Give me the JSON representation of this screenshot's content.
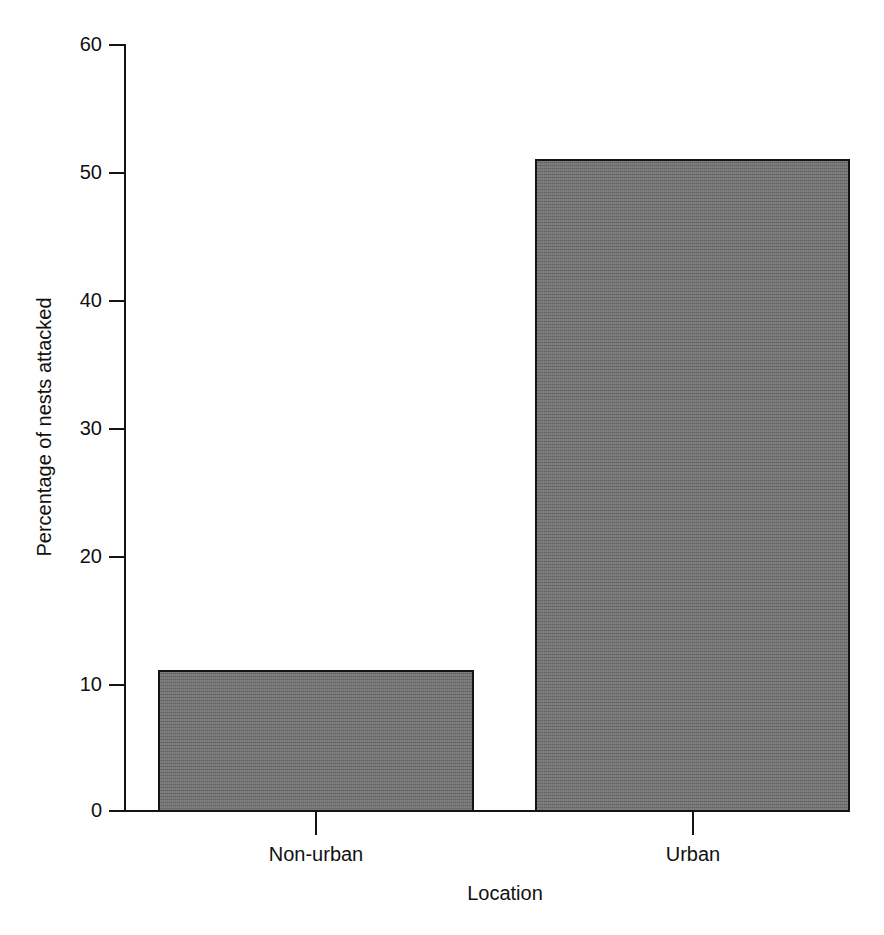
{
  "chart_data": {
    "type": "bar",
    "title": "",
    "subtitle": "",
    "xlabel": "Location",
    "ylabel": "Percentage of nests attacked",
    "categories": [
      "Non-urban",
      "Urban"
    ],
    "values": [
      11,
      51
    ],
    "series": [
      {
        "name": "Percentage of nests attacked",
        "values": [
          11,
          51
        ]
      }
    ],
    "ylim": [
      0,
      60
    ],
    "y_ticks": [
      0,
      10,
      20,
      30,
      40,
      50,
      60
    ],
    "y_tick_labels": [
      "0",
      "10",
      "20",
      "30",
      "40",
      "50",
      "60"
    ],
    "x_tick_labels": [
      "Non-urban",
      "Urban"
    ],
    "grid": false,
    "legend": false,
    "legend_position": "none",
    "bar_fill_color": "#6e6e6e",
    "bar_edge_color": "#141414",
    "axis_color": "#141414",
    "background_color": "#ffffff",
    "annotations": []
  },
  "axis": {
    "y_ticks": [
      {
        "label": "60",
        "value": 60
      },
      {
        "label": "50",
        "value": 50
      },
      {
        "label": "40",
        "value": 40
      },
      {
        "label": "30",
        "value": 30
      },
      {
        "label": "20",
        "value": 20
      },
      {
        "label": "10",
        "value": 10
      },
      {
        "label": "0",
        "value": 0
      }
    ],
    "x_ticks": [
      {
        "label": "Non-urban",
        "value": 11
      },
      {
        "label": "Urban",
        "value": 51
      }
    ],
    "ylabel": "Percentage of nests attacked",
    "xlabel": "Location"
  }
}
